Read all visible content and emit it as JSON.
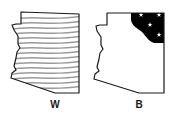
{
  "maps": [
    {
      "label": "W",
      "fill_pattern": "wavy-lines",
      "region": "whole state (lined)",
      "line_color": "#9a9a9a"
    },
    {
      "label": "B",
      "fill_pattern": "solid-black-with-stars",
      "region": "northeast corner",
      "fill_color": "#000000",
      "star_count": 4
    }
  ],
  "colors": {
    "outline": "#1a1a1a",
    "background": "#ffffff"
  }
}
